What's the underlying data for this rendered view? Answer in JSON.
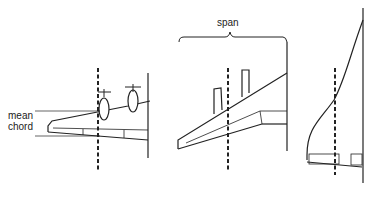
{
  "figure": {
    "panels": [
      {
        "id": "wing-with-propellers",
        "labels": [
          "mean",
          "chord"
        ]
      },
      {
        "id": "swept-wing-with-engines",
        "labels": [
          "span"
        ]
      },
      {
        "id": "delta-wing-ogive",
        "labels": []
      }
    ]
  },
  "labels": {
    "mean": "mean",
    "chord": "chord",
    "span": "span"
  },
  "colors": {
    "line": "#222222",
    "background": "#ffffff"
  }
}
